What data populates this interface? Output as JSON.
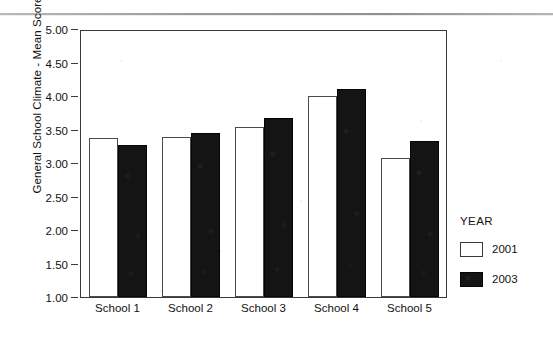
{
  "chart_data": {
    "type": "bar",
    "title": "",
    "subtitle": "",
    "xlabel": "",
    "ylabel": "General School Climate - Mean Score",
    "categories": [
      "School 1",
      "School 2",
      "School 3",
      "School 4",
      "School 5"
    ],
    "series": [
      {
        "name": "2001",
        "color": "#ffffff",
        "values": [
          3.39,
          3.41,
          3.55,
          4.01,
          3.09
        ]
      },
      {
        "name": "2003",
        "color": "#141414",
        "values": [
          3.28,
          3.47,
          3.68,
          4.12,
          3.35
        ]
      }
    ],
    "ylim": [
      1.0,
      5.0
    ],
    "ytick_labels": [
      "5.00",
      "4.50",
      "4.00",
      "3.50",
      "3.00",
      "2.50",
      "2.00",
      "1.50",
      "1.00"
    ],
    "ytick_values": [
      5.0,
      4.5,
      4.0,
      3.5,
      3.0,
      2.5,
      2.0,
      1.5,
      1.0
    ],
    "grid": false,
    "legend_position": "right",
    "legend_title": "YEAR",
    "legend_entries": [
      "2001",
      "2003"
    ]
  },
  "axes": {
    "y_title": "General School Climate - Mean Score"
  },
  "legend": {
    "title": "YEAR",
    "entries": [
      {
        "label": "2001",
        "style": "light"
      },
      {
        "label": "2003",
        "style": "dark"
      }
    ]
  }
}
